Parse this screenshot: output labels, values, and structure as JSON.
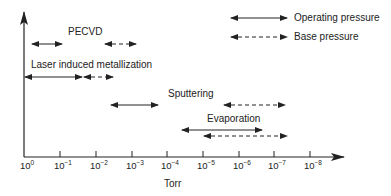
{
  "diagram": {
    "type": "pressure-range-diagram",
    "axis": {
      "label": "Torr",
      "ticks": [
        {
          "base": "10",
          "exp": "0"
        },
        {
          "base": "10",
          "exp": "−1"
        },
        {
          "base": "10",
          "exp": "−2"
        },
        {
          "base": "10",
          "exp": "−3"
        },
        {
          "base": "10",
          "exp": "−4"
        },
        {
          "base": "10",
          "exp": "−5"
        },
        {
          "base": "10",
          "exp": "−6"
        },
        {
          "base": "10",
          "exp": "−7"
        },
        {
          "base": "10",
          "exp": "−8"
        }
      ]
    },
    "legend": {
      "operating": "Operating pressure",
      "base": "Base pressure"
    },
    "processes": [
      {
        "name": "PECVD",
        "operating_range_torr": [
          "~0.8",
          "~1e-1"
        ],
        "base_range_torr": [
          "~2e-2",
          "~2e-3"
        ]
      },
      {
        "name": "Laser induced metallization",
        "operating_range_torr": [
          "1",
          "~3e-2"
        ],
        "base_range_torr": [
          "~3e-2",
          "~3e-3"
        ]
      },
      {
        "name": "Sputtering",
        "operating_range_torr": [
          "~3e-3",
          "~1e-4"
        ],
        "base_range_torr": [
          "~6e-6",
          "~6e-8"
        ]
      },
      {
        "name": "Evaporation",
        "operating_range_torr": [
          "~5e-5",
          "~1e-7"
        ],
        "base_range_torr": [
          "~1e-5",
          "~5e-8"
        ]
      }
    ],
    "colors": {
      "line": "#222222",
      "background": "#ffffff"
    }
  }
}
